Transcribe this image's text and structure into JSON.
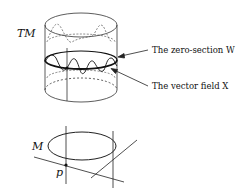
{
  "figure": {
    "top": {
      "space_label": "TM",
      "annotations": [
        {
          "id": "zero-section",
          "text": "The zero-section W"
        },
        {
          "id": "vector-field",
          "text": "The vector field X"
        }
      ]
    },
    "bottom": {
      "manifold_label": "M",
      "point_label": "p"
    }
  },
  "colors": {
    "stroke": "#222222",
    "background": "#ffffff"
  }
}
